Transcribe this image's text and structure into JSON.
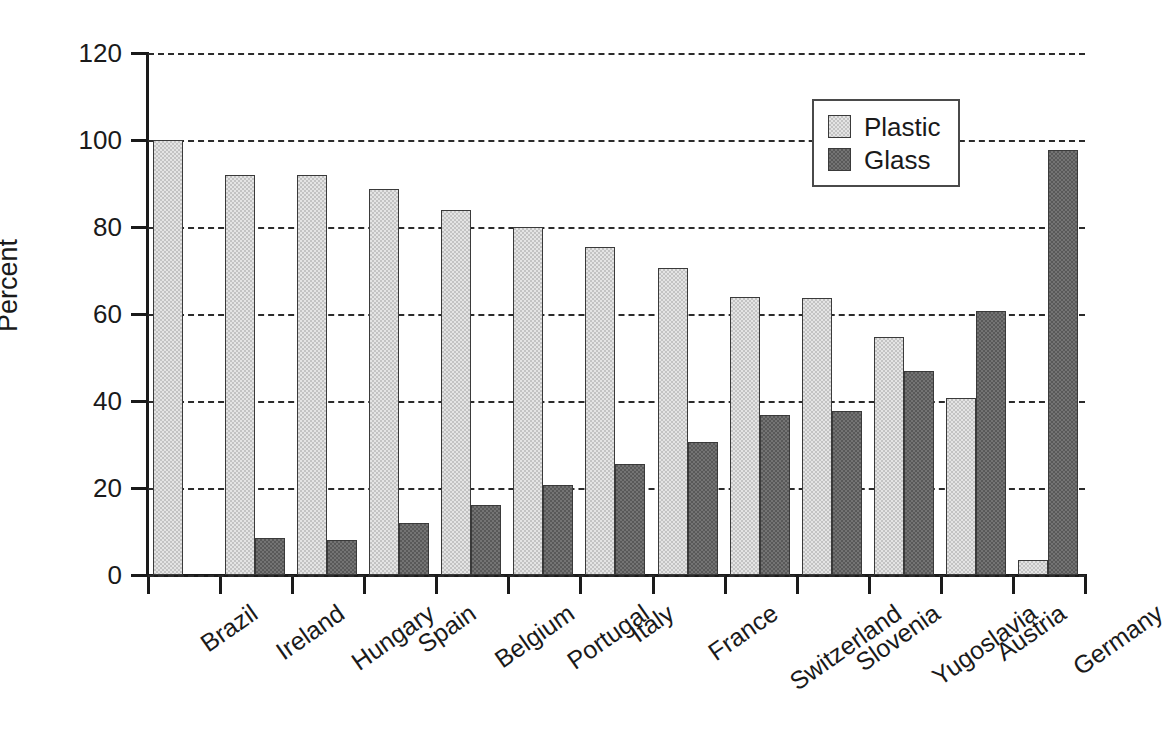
{
  "chart_data": {
    "type": "bar",
    "title": "",
    "subtitle": "",
    "xlabel": "",
    "ylabel": "Percent",
    "ylim": [
      0,
      120
    ],
    "yticks": [
      0,
      20,
      40,
      60,
      80,
      100,
      120
    ],
    "ytick_labels": [
      "0",
      "20",
      "40",
      "60",
      "80",
      "100",
      "120"
    ],
    "grid": "horizontal-dashed",
    "legend_position": "top-right-inside",
    "categories": [
      "Brazil",
      "Ireland",
      "Hungary",
      "Spain",
      "Belgium",
      "Portugal",
      "Italy",
      "France",
      "Switzerland",
      "Slovenia",
      "Yugoslavia",
      "Austria",
      "Germany"
    ],
    "series": [
      {
        "name": "Plastic",
        "color": "#c3c3c3",
        "values": [
          100,
          92,
          92,
          88.7,
          83.8,
          80,
          75.5,
          70.5,
          63.9,
          63.6,
          54.7,
          40.8,
          3.5
        ]
      },
      {
        "name": "Glass",
        "color": "#595959",
        "values": [
          0,
          8.5,
          8.1,
          12,
          16.1,
          20.8,
          25.5,
          30.5,
          36.8,
          37.6,
          46.8,
          60.8,
          97.8
        ]
      }
    ]
  },
  "legend": {
    "items": [
      {
        "label": "Plastic",
        "swatch": "plastic"
      },
      {
        "label": "Glass",
        "swatch": "glass"
      }
    ]
  },
  "axes": {
    "y_title": "Percent"
  }
}
